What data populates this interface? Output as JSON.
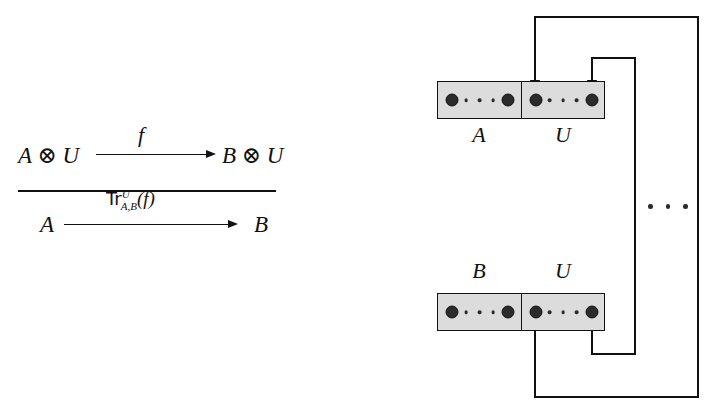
{
  "figure": {
    "caption_none": "",
    "inference_rule": {
      "premise": {
        "source": "A ⊗ U",
        "target": "B ⊗ U",
        "arrow_label": "f"
      },
      "conclusion": {
        "source": "A",
        "target": "B",
        "arrow_label_main": "Tr",
        "arrow_label_superscript": "U",
        "arrow_label_subscript": "A,B",
        "arrow_label_argument": "(f)"
      }
    },
    "trace_diagram": {
      "top_box": {
        "left_label": "A",
        "right_label": "U",
        "left_cell": {
          "port_left": "●",
          "port_right": "●",
          "ellipsis": "· · ·"
        },
        "right_cell": {
          "port_left": "●",
          "port_right": "●",
          "ellipsis": "· · ·"
        }
      },
      "bottom_box": {
        "left_label": "B",
        "right_label": "U",
        "left_cell": {
          "port_left": "●",
          "port_right": "●",
          "ellipsis": "· · ·"
        },
        "right_cell": {
          "port_left": "●",
          "port_right": "●",
          "ellipsis": "· · ·"
        }
      },
      "feedback_ellipsis": "· · ·",
      "feedback_wires": [
        {
          "name": "inner-loop",
          "from": "bottom-U-right-port",
          "to": "top-U-right-port"
        },
        {
          "name": "outer-loop",
          "from": "bottom-U-left-port",
          "to": "top-U-left-port"
        }
      ]
    },
    "colors": {
      "box_fill": "#dcdcdc",
      "stroke": "#111111",
      "port_fill": "#2b2b2b",
      "background": "#ffffff"
    }
  }
}
